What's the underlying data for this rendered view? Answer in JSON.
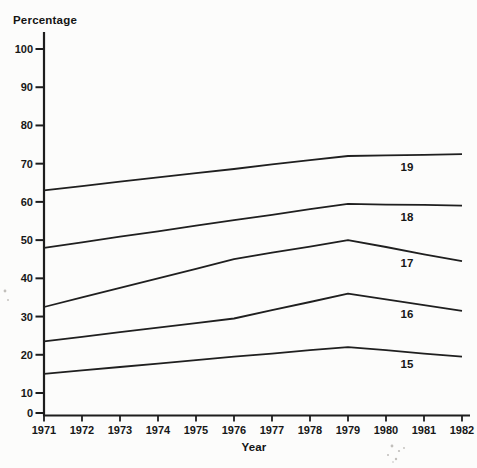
{
  "figure": {
    "y_axis_title": "Percentage",
    "x_axis_title": "Year"
  },
  "chart_data": {
    "type": "line",
    "title": "",
    "ylabel": "Percentage",
    "xlabel": "Year",
    "x": [
      1971,
      1972,
      1973,
      1974,
      1975,
      1976,
      1977,
      1978,
      1979,
      1980,
      1981,
      1982
    ],
    "y_ticks": [
      0,
      10,
      20,
      30,
      40,
      50,
      60,
      70,
      80,
      90,
      100
    ],
    "ylim": [
      0,
      100
    ],
    "grid": false,
    "legend_position": "inline-labels-below-lines",
    "line_color": "#1f1f1f",
    "series": [
      {
        "name": "19",
        "values": [
          63,
          64.1,
          65.3,
          66.4,
          67.5,
          68.6,
          69.8,
          70.9,
          72,
          72.2,
          72.3,
          72.5
        ]
      },
      {
        "name": "18",
        "values": [
          48,
          49.4,
          50.9,
          52.3,
          53.8,
          55.2,
          56.6,
          58.1,
          59.5,
          59.3,
          59.2,
          59
        ]
      },
      {
        "name": "17",
        "values": [
          32.5,
          35,
          37.5,
          40,
          42.5,
          45,
          46.7,
          48.3,
          50,
          48.2,
          46.3,
          44.5
        ]
      },
      {
        "name": "16",
        "values": [
          23.5,
          24.7,
          25.9,
          27.1,
          28.3,
          29.5,
          31.7,
          33.8,
          36,
          34.5,
          33,
          31.5
        ]
      },
      {
        "name": "15",
        "values": [
          15,
          15.9,
          16.8,
          17.7,
          18.6,
          19.5,
          20.3,
          21.2,
          22,
          21.2,
          20.3,
          19.5
        ]
      }
    ]
  }
}
